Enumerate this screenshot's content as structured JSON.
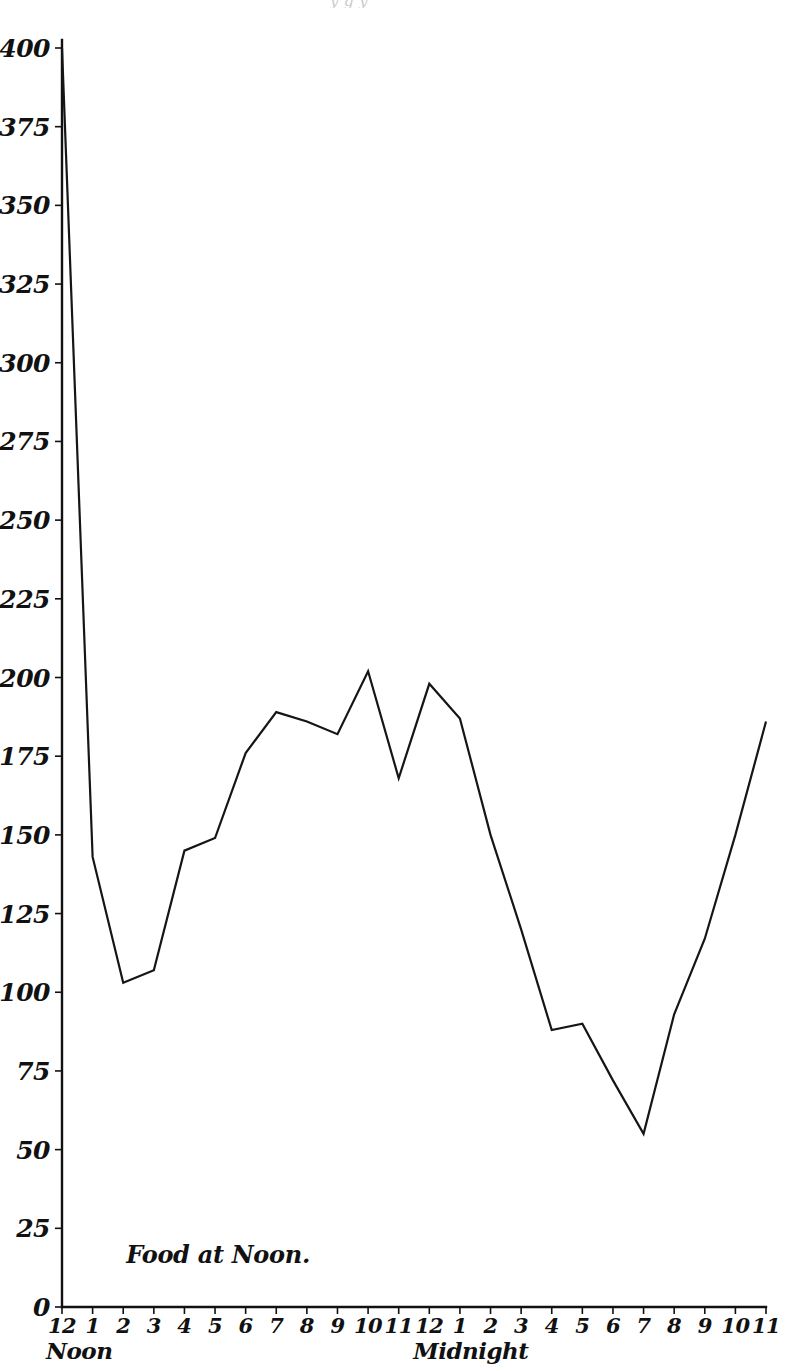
{
  "page": {
    "top_partial_text": "y    g  y"
  },
  "chart_data": {
    "type": "line",
    "title": "",
    "subtitle": "",
    "xlabel": "",
    "ylabel": "",
    "grid": false,
    "legend": null,
    "ylim": [
      0,
      400
    ],
    "ytick_step": 25,
    "yticks": [
      0,
      25,
      50,
      75,
      100,
      125,
      150,
      175,
      200,
      225,
      250,
      275,
      300,
      325,
      350,
      375,
      400
    ],
    "ytick_labels": [
      "0",
      "25",
      "50",
      "75",
      "100",
      "125",
      "150",
      "175",
      "200",
      "225",
      "250",
      "275",
      "300",
      "325",
      "350",
      "375",
      "400"
    ],
    "x": [
      "12",
      "1",
      "2",
      "3",
      "4",
      "5",
      "6",
      "7",
      "8",
      "9",
      "10",
      "11",
      "12",
      "1",
      "2",
      "3",
      "4",
      "5",
      "6",
      "7",
      "8",
      "9",
      "10",
      "11"
    ],
    "xtick_labels": [
      "12",
      "1",
      "2",
      "3",
      "4",
      "5",
      "6",
      "7",
      "8",
      "9",
      "10",
      "11",
      "12",
      "1",
      "2",
      "3",
      "4",
      "5",
      "6",
      "7",
      "8",
      "9",
      "10",
      "11"
    ],
    "xtick_captions": [
      {
        "index": 0,
        "text": "Noon"
      },
      {
        "index": 12,
        "text": "Midnight"
      }
    ],
    "values": [
      400,
      143,
      103,
      107,
      145,
      149,
      176,
      189,
      186,
      182,
      202,
      168,
      198,
      187,
      150,
      120,
      88,
      90,
      72,
      55,
      93,
      117,
      150,
      186
    ],
    "annotations": [
      {
        "text": "Food at Noon.",
        "x_index": 2.1,
        "y_value": 14
      }
    ]
  }
}
